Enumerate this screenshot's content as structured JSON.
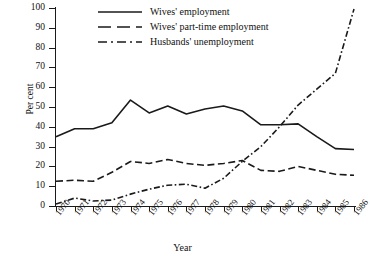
{
  "chart_data": {
    "type": "line",
    "title": "",
    "xlabel": "Year",
    "ylabel": "Per cent",
    "grid": false,
    "legend_position": "top-center",
    "xlim": [
      1970,
      1986
    ],
    "ylim": [
      0,
      100
    ],
    "ytick_labels": [
      "100",
      "90",
      "80",
      "70",
      "60",
      "50",
      "40",
      "30",
      "20",
      "10",
      "0"
    ],
    "ytick_values": [
      100,
      90,
      80,
      70,
      60,
      50,
      40,
      30,
      20,
      10,
      0
    ],
    "categories": [
      "1970",
      "1971",
      "1972",
      "1973",
      "1974",
      "1975",
      "1976",
      "1977",
      "1978",
      "1979",
      "1980",
      "1981",
      "1982",
      "1983",
      "1984",
      "1985",
      "1986"
    ],
    "x": [
      1970,
      1971,
      1972,
      1973,
      1974,
      1975,
      1976,
      1977,
      1978,
      1979,
      1980,
      1981,
      1982,
      1983,
      1984,
      1985,
      1986
    ],
    "series": [
      {
        "name": "Wives' employment",
        "style": "solid",
        "color": "#1a1a1a",
        "values": [
          35,
          39,
          39,
          42,
          53.5,
          47,
          50.5,
          46.5,
          49,
          50.5,
          48,
          41,
          41,
          41.5,
          35,
          29,
          28.5
        ]
      },
      {
        "name": "Wives' part-time employment",
        "style": "dashed",
        "color": "#1a1a1a",
        "values": [
          12.5,
          13,
          12.5,
          17,
          22.5,
          21.5,
          23.5,
          21.5,
          20.5,
          21.5,
          23,
          18,
          17.5,
          20,
          18,
          16,
          15.5
        ]
      },
      {
        "name": "Husbands' unemployment",
        "style": "dashdot",
        "color": "#1a1a1a",
        "values": [
          1,
          4,
          2.5,
          3,
          6,
          8.5,
          10.5,
          11,
          9,
          14,
          22.5,
          30,
          40,
          51,
          59,
          67,
          99.5
        ]
      }
    ]
  }
}
